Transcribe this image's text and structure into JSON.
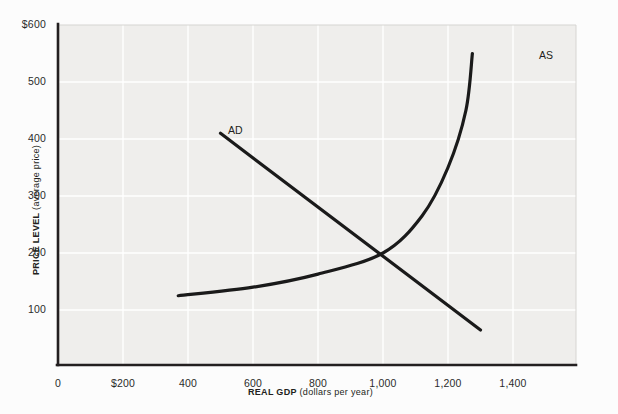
{
  "chart_data": {
    "type": "line",
    "title": "",
    "xlabel_bold": "REAL GDP",
    "xlabel_paren": " (dollars per year)",
    "ylabel_bold": "PRICE LEVEL",
    "ylabel_paren": " (average price)",
    "xlim": [
      0,
      1400
    ],
    "ylim": [
      0,
      600
    ],
    "xticks": [
      0,
      200,
      400,
      600,
      800,
      1000,
      1200,
      1400
    ],
    "xtick_labels": [
      "0",
      "$200",
      "400",
      "600",
      "800",
      "1,000",
      "1,200",
      "1,400"
    ],
    "yticks": [
      100,
      200,
      300,
      400,
      500,
      600
    ],
    "ytick_labels": [
      "100",
      "200",
      "300",
      "400",
      "500",
      "$600"
    ],
    "grid": true,
    "legend": "none",
    "equilibrium": {
      "x": 1000,
      "y": 200
    },
    "series": [
      {
        "name": "AD",
        "label": "AD",
        "shape": "straight-downward-sloping",
        "color": "#1a1a1a",
        "points": [
          {
            "x": 500,
            "y": 410
          },
          {
            "x": 1300,
            "y": 65
          }
        ]
      },
      {
        "name": "AS",
        "label": "AS",
        "shape": "upward-sloping-convex",
        "color": "#1a1a1a",
        "points": [
          {
            "x": 370,
            "y": 125
          },
          {
            "x": 600,
            "y": 140
          },
          {
            "x": 800,
            "y": 163
          },
          {
            "x": 1000,
            "y": 200
          },
          {
            "x": 1120,
            "y": 265
          },
          {
            "x": 1200,
            "y": 350
          },
          {
            "x": 1255,
            "y": 450
          },
          {
            "x": 1275,
            "y": 550
          }
        ]
      }
    ]
  },
  "plot": {
    "background": "#efeeec",
    "gridline_color": "#ffffff",
    "axis_color": "#231f20",
    "page_background": "#fcfcfc"
  }
}
